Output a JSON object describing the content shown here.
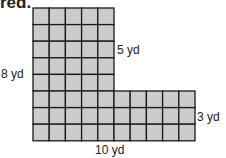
{
  "header": {
    "text": "red."
  },
  "figure": {
    "fill_color": "#cccccc",
    "line_color": "#1a1a1a",
    "grid_cell_px": 16.2,
    "labels": {
      "left": "8 yd",
      "upper_right": "5 yd",
      "lower_right": "3 yd",
      "bottom": "10 yd"
    },
    "shape": {
      "description": "L-shaped grid: 5 wide x 8 tall column plus 10 wide x 3 tall base",
      "top_part": {
        "cols": 5,
        "rows": 5
      },
      "bottom_part": {
        "cols": 10,
        "rows": 3
      }
    }
  }
}
